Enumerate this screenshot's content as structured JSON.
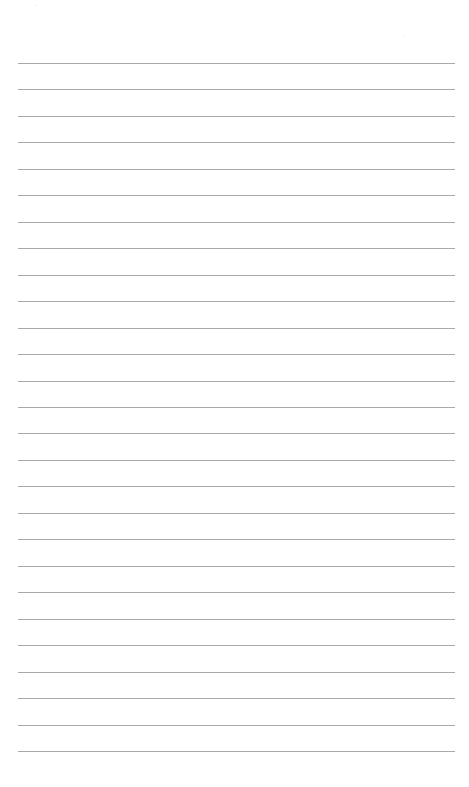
{
  "page": {
    "type": "lined-paper",
    "background_color": "#ffffff",
    "line_color": "#a9a9a9",
    "line_count": 27,
    "first_line_y": 63,
    "line_spacing": 26.46,
    "line_left": 18,
    "line_right": 455
  }
}
